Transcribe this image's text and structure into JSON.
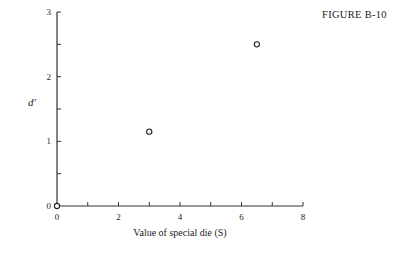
{
  "figure_label": "FIGURE B-10",
  "chart_data": {
    "type": "scatter",
    "title": "",
    "xlabel": "Value of special die (S)",
    "ylabel": "d'",
    "xlim": [
      0,
      8
    ],
    "ylim": [
      0,
      3
    ],
    "x_ticks_major": [
      0,
      2,
      4,
      6,
      8
    ],
    "x_ticks_minor": [
      1,
      3,
      5,
      7
    ],
    "y_ticks_major": [
      0,
      1,
      2,
      3
    ],
    "y_ticks_minor": [
      0.5,
      1.5,
      2.5
    ],
    "grid": false,
    "legend": null,
    "marker": "open-circle",
    "series": [
      {
        "name": "d' vs S",
        "points": [
          {
            "x": 0,
            "y": 0
          },
          {
            "x": 3,
            "y": 1.15
          },
          {
            "x": 6.5,
            "y": 2.5
          }
        ]
      }
    ]
  },
  "colors": {
    "axis": "#333333",
    "marker": "#222222",
    "background": "#ffffff"
  }
}
